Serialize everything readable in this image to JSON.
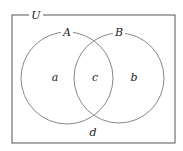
{
  "diagram": {
    "type": "venn",
    "universe_label": "U",
    "sets": [
      {
        "label": "A",
        "cx": 67,
        "cy": 78,
        "r": 46
      },
      {
        "label": "B",
        "cx": 119,
        "cy": 78,
        "r": 45
      }
    ],
    "regions": {
      "a": "a",
      "c": "c",
      "b": "b",
      "d": "d"
    },
    "colors": {
      "stroke": "#555555",
      "circle_stroke": "#888888",
      "text": "#222222",
      "background": "#ffffff"
    }
  }
}
